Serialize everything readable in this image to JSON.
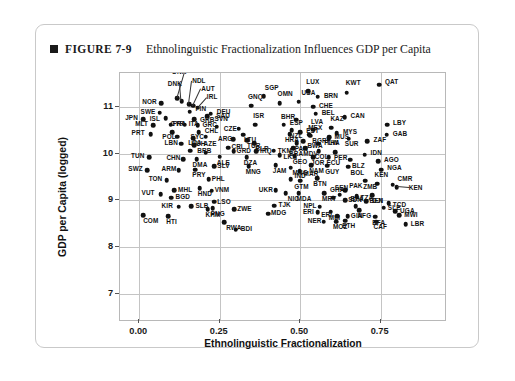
{
  "figure": {
    "marker_icon": "square-bullet-icon",
    "number": "FIGURE 7-9",
    "title": "Ethnolinguistic Fractionalization Influences GDP per Capita"
  },
  "chart_data": {
    "type": "scatter",
    "title": "Ethnolinguistic Fractionalization Influences GDP per Capita",
    "xlabel": "Ethnolinguistic Fractionalization",
    "ylabel": "GDP per Capita (logged)",
    "xlim": [
      -0.06,
      0.95
    ],
    "ylim": [
      6.45,
      11.72
    ],
    "xticks": [
      "0.00",
      "0.25",
      "0.50",
      "0.75"
    ],
    "xtick_values": [
      0.0,
      0.25,
      0.5,
      0.75
    ],
    "yticks": [
      "7",
      "8",
      "9",
      "10",
      "11"
    ],
    "ytick_values": [
      7,
      8,
      9,
      10,
      11
    ],
    "grid": true,
    "legend": "none",
    "point_color": "#111111",
    "points": [
      {
        "label": "QAT",
        "x": 0.745,
        "y": 11.47,
        "lx": 6,
        "ly": -3
      },
      {
        "label": "LUX",
        "x": 0.525,
        "y": 11.33,
        "lx": -2,
        "ly": -9
      },
      {
        "label": "KWT",
        "x": 0.645,
        "y": 11.3,
        "lx": -1,
        "ly": -9
      },
      {
        "label": "BRN",
        "x": 0.555,
        "y": 11.21,
        "lx": 6,
        "ly": -1
      },
      {
        "label": "SGP",
        "x": 0.387,
        "y": 11.23,
        "lx": 1,
        "ly": -8
      },
      {
        "label": "NOR",
        "x": 0.068,
        "y": 11.07,
        "lx": -19,
        "ly": -1
      },
      {
        "label": "DNK",
        "x": 0.118,
        "y": 11.18,
        "lx": -5,
        "ly": -26,
        "leader": true
      },
      {
        "label": "DNK",
        "x": 0.132,
        "y": 11.12,
        "lx": -14,
        "ly": -17,
        "leader": true
      },
      {
        "label": "NDL",
        "x": 0.155,
        "y": 11.06,
        "lx": 3,
        "ly": -23,
        "leader": true
      },
      {
        "label": "AUT",
        "x": 0.168,
        "y": 11.02,
        "lx": 8,
        "ly": -17,
        "leader": true
      },
      {
        "label": "IRL",
        "x": 0.182,
        "y": 10.98,
        "lx": 9,
        "ly": -10,
        "leader": true
      },
      {
        "label": "CHE",
        "x": 0.54,
        "y": 11.0,
        "lx": 6,
        "ly": -1
      },
      {
        "label": "USA",
        "x": 0.495,
        "y": 11.11,
        "lx": 3,
        "ly": -8
      },
      {
        "label": "OMN",
        "x": 0.436,
        "y": 11.07,
        "lx": -2,
        "ly": -9
      },
      {
        "label": "GNQ",
        "x": 0.347,
        "y": 11.02,
        "lx": -3,
        "ly": -9
      },
      {
        "label": "SWE",
        "x": 0.063,
        "y": 10.87,
        "lx": -19,
        "ly": -1
      },
      {
        "label": "FIN",
        "x": 0.156,
        "y": 10.89,
        "lx": 6,
        "ly": -3
      },
      {
        "label": "DEU",
        "x": 0.222,
        "y": 10.85,
        "lx": 6,
        "ly": -2
      },
      {
        "label": "BEL",
        "x": 0.548,
        "y": 10.85,
        "lx": 6,
        "ly": -1
      },
      {
        "label": "CAN",
        "x": 0.638,
        "y": 10.78,
        "lx": 6,
        "ly": -1
      },
      {
        "label": "JPN",
        "x": 0.012,
        "y": 10.74,
        "lx": -18,
        "ly": -1
      },
      {
        "label": "ISL",
        "x": 0.082,
        "y": 10.75,
        "lx": -16,
        "ly": 1
      },
      {
        "label": "GRB",
        "x": 0.17,
        "y": 10.73,
        "lx": 6,
        "ly": 1
      },
      {
        "label": "SAU",
        "x": 0.211,
        "y": 10.8,
        "lx": 9,
        "ly": 0
      },
      {
        "label": "BHR",
        "x": 0.487,
        "y": 10.72,
        "lx": -15,
        "ly": -3
      },
      {
        "label": "LBY",
        "x": 0.77,
        "y": 10.62,
        "lx": 6,
        "ly": -1
      },
      {
        "label": "MLT",
        "x": 0.043,
        "y": 10.61,
        "lx": -18,
        "ly": -1
      },
      {
        "label": "FRA",
        "x": 0.097,
        "y": 10.62,
        "lx": 2,
        "ly": 0
      },
      {
        "label": "ITA",
        "x": 0.141,
        "y": 10.62,
        "lx": 4,
        "ly": 0
      },
      {
        "label": "GRC",
        "x": 0.181,
        "y": 10.61,
        "lx": 5,
        "ly": 0
      },
      {
        "label": "ISR",
        "x": 0.36,
        "y": 10.62,
        "lx": -2,
        "ly": -8
      },
      {
        "label": "ESP",
        "x": 0.449,
        "y": 10.62,
        "lx": 6,
        "ly": -1
      },
      {
        "label": "EST",
        "x": 0.5,
        "y": 10.46,
        "lx": 6,
        "ly": -1
      },
      {
        "label": "LVA",
        "x": 0.54,
        "y": 10.51,
        "lx": -2,
        "ly": -8
      },
      {
        "label": "KAZ",
        "x": 0.597,
        "y": 10.55,
        "lx": -1,
        "ly": -9
      },
      {
        "label": "MYS",
        "x": 0.614,
        "y": 10.44,
        "lx": 6,
        "ly": -1
      },
      {
        "label": "PRT",
        "x": 0.035,
        "y": 10.41,
        "lx": -19,
        "ly": -1
      },
      {
        "label": "CYP",
        "x": 0.103,
        "y": 10.46,
        "lx": -2,
        "ly": -8
      },
      {
        "label": "CHL",
        "x": 0.185,
        "y": 10.46,
        "lx": 6,
        "ly": -1
      },
      {
        "label": "SVN",
        "x": 0.24,
        "y": 10.57,
        "lx": -2,
        "ly": -8
      },
      {
        "label": "CZE",
        "x": 0.309,
        "y": 10.53,
        "lx": -15,
        "ly": 0
      },
      {
        "label": "NZL",
        "x": 0.474,
        "y": 10.5,
        "lx": -2,
        "ly": 6
      },
      {
        "label": "MEX",
        "x": 0.531,
        "y": 10.38,
        "lx": -2,
        "ly": -8
      },
      {
        "label": "GAB",
        "x": 0.769,
        "y": 10.4,
        "lx": 6,
        "ly": -1
      },
      {
        "label": "SYC",
        "x": 0.206,
        "y": 10.36,
        "lx": -15,
        "ly": 0
      },
      {
        "label": "LTU",
        "x": 0.322,
        "y": 10.4,
        "lx": 1,
        "ly": 5
      },
      {
        "label": "POL",
        "x": 0.118,
        "y": 10.36,
        "lx": -15,
        "ly": 0
      },
      {
        "label": "HUH",
        "x": 0.168,
        "y": 10.33,
        "lx": -2,
        "ly": 6
      },
      {
        "label": "HRA",
        "x": 0.468,
        "y": 10.42,
        "lx": -5,
        "ly": 6
      },
      {
        "label": "BGR",
        "x": 0.528,
        "y": 10.4,
        "lx": 3,
        "ly": 6
      },
      {
        "label": "THA",
        "x": 0.59,
        "y": 10.35,
        "lx": -3,
        "ly": 6
      },
      {
        "label": "SUR",
        "x": 0.651,
        "y": 10.32,
        "lx": -4,
        "ly": 6
      },
      {
        "label": "ZAF",
        "x": 0.709,
        "y": 10.27,
        "lx": 6,
        "ly": -1
      },
      {
        "label": "ARG",
        "x": 0.291,
        "y": 10.31,
        "lx": -15,
        "ly": 0
      },
      {
        "label": "TUR",
        "x": 0.335,
        "y": 10.28,
        "lx": 0,
        "ly": 6
      },
      {
        "label": "BWA",
        "x": 0.51,
        "y": 10.26,
        "lx": 4,
        "ly": 5
      },
      {
        "label": "MUS",
        "x": 0.588,
        "y": 10.33,
        "lx": 6,
        "ly": -1
      },
      {
        "label": "LBN",
        "x": 0.131,
        "y": 10.21,
        "lx": -17,
        "ly": -1
      },
      {
        "label": "BRB",
        "x": 0.171,
        "y": 10.18,
        "lx": 3,
        "ly": 6
      },
      {
        "label": "BLR",
        "x": 0.357,
        "y": 10.22,
        "lx": 1,
        "ly": 6
      },
      {
        "label": "PAN",
        "x": 0.489,
        "y": 10.22,
        "lx": -2,
        "ly": 6
      },
      {
        "label": "PLW",
        "x": 0.556,
        "y": 10.21,
        "lx": 6,
        "ly": -1
      },
      {
        "label": "BRA",
        "x": 0.478,
        "y": 10.11,
        "lx": -4,
        "ly": 6
      },
      {
        "label": "MDV",
        "x": 0.516,
        "y": 10.12,
        "lx": -2,
        "ly": 6
      },
      {
        "label": "CRI",
        "x": 0.277,
        "y": 10.13,
        "lx": 3,
        "ly": 0
      },
      {
        "label": "LCA",
        "x": 0.158,
        "y": 10.06,
        "lx": -2,
        "ly": -8
      },
      {
        "label": "AZE",
        "x": 0.206,
        "y": 10.02,
        "lx": -2,
        "ly": -8
      },
      {
        "label": "GRD",
        "x": 0.293,
        "y": 10.05,
        "lx": 3,
        "ly": 0
      },
      {
        "label": "IRQ",
        "x": 0.363,
        "y": 10.05,
        "lx": 4,
        "ly": 0
      },
      {
        "label": "TKM",
        "x": 0.418,
        "y": 10.06,
        "lx": 4,
        "ly": 0
      },
      {
        "label": "COL",
        "x": 0.558,
        "y": 10.05,
        "lx": -4,
        "ly": 6
      },
      {
        "label": "PER",
        "x": 0.608,
        "y": 10.03,
        "lx": -1,
        "ly": 6
      },
      {
        "label": "IDN",
        "x": 0.7,
        "y": 9.98,
        "lx": 6,
        "ly": -1
      },
      {
        "label": "TUN",
        "x": 0.03,
        "y": 9.92,
        "lx": -18,
        "ly": -1
      },
      {
        "label": "CHN",
        "x": 0.137,
        "y": 9.88,
        "lx": -17,
        "ly": -1
      },
      {
        "label": "DMA",
        "x": 0.178,
        "y": 9.88,
        "lx": -4,
        "ly": 6
      },
      {
        "label": "ALE",
        "x": 0.25,
        "y": 9.93,
        "lx": -3,
        "ly": 6
      },
      {
        "label": "DZA",
        "x": 0.334,
        "y": 9.92,
        "lx": -3,
        "ly": 6
      },
      {
        "label": "LKA",
        "x": 0.436,
        "y": 9.97,
        "lx": 4,
        "ly": 2
      },
      {
        "label": "GEO",
        "x": 0.483,
        "y": 9.95,
        "lx": -2,
        "ly": 6
      },
      {
        "label": "JOR",
        "x": 0.54,
        "y": 9.92,
        "lx": -2,
        "ly": 6
      },
      {
        "label": "ECU",
        "x": 0.588,
        "y": 9.92,
        "lx": -2,
        "ly": 6
      },
      {
        "label": "BLZ",
        "x": 0.655,
        "y": 9.87,
        "lx": 2,
        "ly": 6
      },
      {
        "label": "AGO",
        "x": 0.742,
        "y": 9.84,
        "lx": 6,
        "ly": -1
      },
      {
        "label": "SWZ",
        "x": 0.025,
        "y": 9.65,
        "lx": -19,
        "ly": -1
      },
      {
        "label": "ARM",
        "x": 0.122,
        "y": 9.64,
        "lx": -17,
        "ly": -1
      },
      {
        "label": "PRY",
        "x": 0.174,
        "y": 9.66,
        "lx": -3,
        "ly": 6
      },
      {
        "label": "SLV",
        "x": 0.233,
        "y": 9.73,
        "lx": 3,
        "ly": 0
      },
      {
        "label": "MNG",
        "x": 0.34,
        "y": 9.73,
        "lx": -3,
        "ly": 6
      },
      {
        "label": "JAM",
        "x": 0.424,
        "y": 9.75,
        "lx": -3,
        "ly": 6
      },
      {
        "label": "MNG",
        "x": 0.47,
        "y": 9.7,
        "lx": 2,
        "ly": 6
      },
      {
        "label": "NAM",
        "x": 0.534,
        "y": 9.75,
        "lx": -2,
        "ly": 6
      },
      {
        "label": "GUY",
        "x": 0.584,
        "y": 9.74,
        "lx": -2,
        "ly": 6
      },
      {
        "label": "BOL",
        "x": 0.65,
        "y": 9.72,
        "lx": 2,
        "ly": 6
      },
      {
        "label": "NGA",
        "x": 0.752,
        "y": 9.66,
        "lx": 6,
        "ly": -1
      },
      {
        "label": "MAR",
        "x": 0.498,
        "y": 9.62,
        "lx": 4,
        "ly": 3
      },
      {
        "label": "TON",
        "x": 0.085,
        "y": 9.43,
        "lx": -18,
        "ly": -1
      },
      {
        "label": "PHL",
        "x": 0.216,
        "y": 9.45,
        "lx": 3,
        "ly": 0
      },
      {
        "label": "IND",
        "x": 0.47,
        "y": 9.45,
        "lx": 4,
        "ly": -3
      },
      {
        "label": "GTM",
        "x": 0.5,
        "y": 9.42,
        "lx": -6,
        "ly": 6
      },
      {
        "label": "BTN",
        "x": 0.553,
        "y": 9.48,
        "lx": -4,
        "ly": 6
      },
      {
        "label": "ZMB",
        "x": 0.702,
        "y": 9.42,
        "lx": -2,
        "ly": 6
      },
      {
        "label": "KEN",
        "x": 0.74,
        "y": 9.36,
        "lx": -3,
        "ly": -8
      },
      {
        "label": "CMR",
        "x": 0.787,
        "y": 9.34,
        "lx": 5,
        "ly": -5
      },
      {
        "label": "KEN",
        "x": 0.8,
        "y": 9.28,
        "lx": 12,
        "ly": 1,
        "leader": true
      },
      {
        "label": "MHL",
        "x": 0.108,
        "y": 9.22,
        "lx": 4,
        "ly": 0
      },
      {
        "label": "HND",
        "x": 0.188,
        "y": 9.26,
        "lx": -2,
        "ly": 6
      },
      {
        "label": "VNM",
        "x": 0.225,
        "y": 9.21,
        "lx": 3,
        "ly": 0
      },
      {
        "label": "UKR",
        "x": 0.424,
        "y": 9.22,
        "lx": -17,
        "ly": 0
      },
      {
        "label": "NIC",
        "x": 0.455,
        "y": 9.15,
        "lx": 2,
        "ly": 6
      },
      {
        "label": "MDA",
        "x": 0.495,
        "y": 9.15,
        "lx": -2,
        "ly": 6
      },
      {
        "label": "MRT",
        "x": 0.574,
        "y": 9.16,
        "lx": -2,
        "ly": 6
      },
      {
        "label": "SEN",
        "x": 0.623,
        "y": 9.12,
        "lx": -5,
        "ly": -7
      },
      {
        "label": "TZA",
        "x": 0.675,
        "y": 9.09,
        "lx": 4,
        "ly": 2
      },
      {
        "label": "DJI",
        "x": 0.724,
        "y": 9.11,
        "lx": 0,
        "ly": 6
      },
      {
        "label": "BGD",
        "x": 0.1,
        "y": 9.06,
        "lx": 4,
        "ly": 0
      },
      {
        "label": "VUT",
        "x": 0.066,
        "y": 9.13,
        "lx": -19,
        "ly": -1
      },
      {
        "label": "GHA",
        "x": 0.602,
        "y": 9.06,
        "lx": -3,
        "ly": -7
      },
      {
        "label": "SDN",
        "x": 0.64,
        "y": 9.01,
        "lx": 3,
        "ly": 0
      },
      {
        "label": "BEN",
        "x": 0.706,
        "y": 8.98,
        "lx": 3,
        "ly": 0
      },
      {
        "label": "TCD",
        "x": 0.775,
        "y": 8.94,
        "lx": 4,
        "ly": 2
      },
      {
        "label": "KIR",
        "x": 0.122,
        "y": 8.87,
        "lx": -17,
        "ly": 0
      },
      {
        "label": "SLB",
        "x": 0.162,
        "y": 8.88,
        "lx": 4,
        "ly": 0
      },
      {
        "label": "KHM",
        "x": 0.212,
        "y": 8.82,
        "lx": -2,
        "ly": 6
      },
      {
        "label": "TJK",
        "x": 0.42,
        "y": 8.89,
        "lx": 4,
        "ly": 0
      },
      {
        "label": "NPL",
        "x": 0.56,
        "y": 8.87,
        "lx": -16,
        "ly": 0
      },
      {
        "label": "BFA",
        "x": 0.672,
        "y": 8.88,
        "lx": -5,
        "ly": -7
      },
      {
        "label": "SLE",
        "x": 0.76,
        "y": 8.85,
        "lx": 4,
        "ly": 1
      },
      {
        "label": "COM",
        "x": 0.012,
        "y": 8.69,
        "lx": 0,
        "ly": 6
      },
      {
        "label": "HTI",
        "x": 0.09,
        "y": 8.67,
        "lx": -2,
        "ly": 6
      },
      {
        "label": "LSO",
        "x": 0.233,
        "y": 8.97,
        "lx": 3,
        "ly": 0
      },
      {
        "label": "PNG",
        "x": 0.228,
        "y": 8.83,
        "lx": -2,
        "ly": 6
      },
      {
        "label": "ZWE",
        "x": 0.295,
        "y": 8.82,
        "lx": 3,
        "ly": 0
      },
      {
        "label": "MDG",
        "x": 0.4,
        "y": 8.72,
        "lx": 3,
        "ly": 0
      },
      {
        "label": "ERI",
        "x": 0.555,
        "y": 8.75,
        "lx": -15,
        "ly": 0
      },
      {
        "label": "MLI",
        "x": 0.595,
        "y": 8.76,
        "lx": -2,
        "ly": 6
      },
      {
        "label": "AFG",
        "x": 0.684,
        "y": 8.79,
        "lx": -2,
        "ly": 6
      },
      {
        "label": "ERI",
        "x": 0.615,
        "y": 8.66,
        "lx": -16,
        "ly": -1
      },
      {
        "label": "GIN",
        "x": 0.648,
        "y": 8.67,
        "lx": 3,
        "ly": 0
      },
      {
        "label": "BFA",
        "x": 0.733,
        "y": 8.65,
        "lx": -3,
        "ly": 6
      },
      {
        "label": "MWI",
        "x": 0.808,
        "y": 8.69,
        "lx": 5,
        "ly": 0
      },
      {
        "label": "ETH",
        "x": 0.64,
        "y": 8.57,
        "lx": -3,
        "ly": 6
      },
      {
        "label": "NER",
        "x": 0.573,
        "y": 8.55,
        "lx": -16,
        "ly": 0
      },
      {
        "label": "MOZ",
        "x": 0.611,
        "y": 8.55,
        "lx": -3,
        "ly": 6
      },
      {
        "label": "CAF",
        "x": 0.737,
        "y": 8.55,
        "lx": -3,
        "ly": 6
      },
      {
        "label": "UGA",
        "x": 0.795,
        "y": 8.77,
        "lx": 5,
        "ly": 0
      },
      {
        "label": "LBR",
        "x": 0.828,
        "y": 8.5,
        "lx": 5,
        "ly": 0
      },
      {
        "label": "RWA",
        "x": 0.264,
        "y": 8.54,
        "lx": 2,
        "ly": 6
      },
      {
        "label": "PAK",
        "x": 0.64,
        "y": 9.22,
        "lx": 4,
        "ly": -4
      },
      {
        "label": "BDI",
        "x": 0.3,
        "y": 8.38,
        "lx": 5,
        "ly": 0
      }
    ]
  }
}
